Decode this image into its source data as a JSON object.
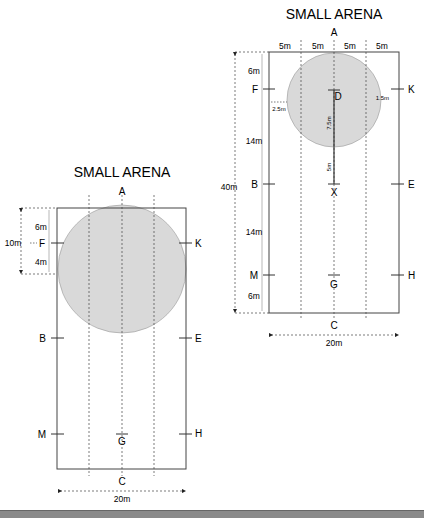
{
  "diagrams": [
    {
      "id": "right",
      "title": "SMALL ARENA",
      "width_label": "20m",
      "length_label": "40m",
      "column_labels": [
        "5m",
        "5m",
        "5m",
        "5m"
      ],
      "left_segments": [
        "6m",
        "14m",
        "14m",
        "6m"
      ],
      "markers": {
        "A": "A",
        "C": "C",
        "D": "D",
        "X": "X",
        "G": "G",
        "F": "F",
        "B": "B",
        "M": "M",
        "K": "K",
        "E": "E",
        "H": "H"
      },
      "small_measures": {
        "f_offset": "2.5m",
        "k_offset": "1.5m",
        "d_radius": "7.5m",
        "circle_to_x": "5m"
      }
    },
    {
      "id": "left",
      "title": "SMALL ARENA",
      "width_label": "20m",
      "total_label": "10m",
      "left_segments": [
        "6m",
        "4m"
      ],
      "markers": {
        "A": "A",
        "C": "C",
        "G": "G",
        "F": "F",
        "B": "B",
        "M": "M",
        "K": "K",
        "E": "E",
        "H": "H"
      }
    }
  ],
  "colors": {
    "circle_fill": "#d9d9d9",
    "line": "#333333",
    "border": "#555555"
  }
}
